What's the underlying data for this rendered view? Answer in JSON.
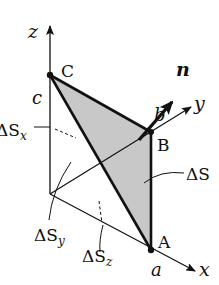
{
  "diagram": {
    "type": "tetrahedron-surface-element",
    "axes": {
      "x_label": "x",
      "y_label": "y",
      "z_label": "z"
    },
    "points": {
      "A": "A",
      "B": "B",
      "C": "C"
    },
    "intercepts": {
      "a": "a",
      "b": "b",
      "c": "c"
    },
    "normal_label": "n",
    "surface_labels": {
      "dS": "ΔS",
      "dSx_base": "ΔS",
      "dSx_sub": "x",
      "dSy_base": "ΔS",
      "dSy_sub": "y",
      "dSz_base": "ΔS",
      "dSz_sub": "z"
    },
    "colors": {
      "fill": "#c8c8c8",
      "stroke": "#111111"
    }
  }
}
